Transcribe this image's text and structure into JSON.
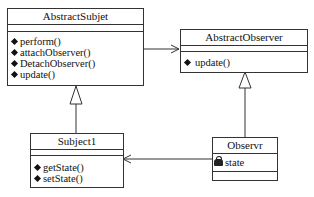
{
  "diagram": {
    "type": "uml-class-diagram",
    "pattern": "observer",
    "classes": [
      {
        "name": "AbstractSubjet",
        "attributes": [],
        "operations": [
          "perform()",
          "attachObserver()",
          "DetachObserver()",
          "update()"
        ]
      },
      {
        "name": "AbstractObserver",
        "attributes": [],
        "operations": [
          "update()"
        ]
      },
      {
        "name": "Subject1",
        "attributes": [],
        "operations": [
          "getState()",
          "setState()"
        ]
      },
      {
        "name": "Observr",
        "attributes": [
          "state"
        ],
        "operations": []
      }
    ],
    "relations": [
      {
        "from": "AbstractSubjet",
        "to": "AbstractObserver",
        "type": "association",
        "arrow": "open"
      },
      {
        "from": "Subject1",
        "to": "AbstractSubjet",
        "type": "generalization",
        "arrow": "hollow-triangle"
      },
      {
        "from": "Observr",
        "to": "AbstractObserver",
        "type": "generalization",
        "arrow": "hollow-triangle"
      },
      {
        "from": "Observr",
        "to": "Subject1",
        "type": "association",
        "arrow": "open"
      }
    ]
  }
}
